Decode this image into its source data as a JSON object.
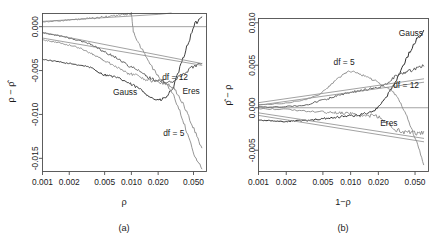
{
  "figure": {
    "background": "#ffffff",
    "panels": [
      {
        "tag": "(a)",
        "xlabel": "ρ",
        "ylabel": "ρ − ρ̂",
        "xticks": [
          "0.001",
          "0.002",
          "0.005",
          "0.010",
          "0.020",
          "0.050"
        ],
        "yticks": [
          "0.000",
          "-0.005",
          "-0.010",
          "-0.015"
        ],
        "curve_labels": [
          {
            "text": "Gauss",
            "x": 0.0085,
            "y": -0.0078
          },
          {
            "text": "df = 12",
            "x": 0.031,
            "y": -0.0061
          },
          {
            "text": "Eres",
            "x": 0.047,
            "y": -0.0077
          },
          {
            "text": "df = 5",
            "x": 0.03,
            "y": -0.0125
          }
        ]
      },
      {
        "tag": "(b)",
        "xlabel": "1−ρ",
        "ylabel": "ρ̂ − ρ",
        "xticks": [
          "0.001",
          "0.002",
          "0.005",
          "0.010",
          "0.020",
          "0.050"
        ],
        "yticks": [
          "0.010",
          "0.005",
          "0.000",
          "-0.005"
        ],
        "curve_labels": [
          {
            "text": "Gauss",
            "x": 0.045,
            "y": 0.0085
          },
          {
            "text": "df = 5",
            "x": 0.0085,
            "y": 0.005
          },
          {
            "text": "df = 12",
            "x": 0.04,
            "y": 0.0023
          },
          {
            "text": "Eres",
            "x": 0.026,
            "y": -0.0021
          }
        ]
      }
    ]
  },
  "chart_data": [
    {
      "type": "line",
      "panel": "(a)",
      "title": "",
      "xlabel": "ρ",
      "ylabel": "ρ − ρ̂",
      "xscale": "log",
      "xlim": [
        0.001,
        0.07
      ],
      "ylim": [
        -0.0165,
        0.0015
      ],
      "grid": false,
      "legend": "inline-annotations",
      "xticks": [
        0.001,
        0.002,
        0.005,
        0.01,
        0.02,
        0.05
      ],
      "xticklabels": [
        "0.001",
        "0.002",
        "0.005",
        "0.010",
        "0.020",
        "0.050"
      ],
      "yticks": [
        0.0,
        -0.005,
        -0.01,
        -0.015
      ],
      "yticklabels": [
        "0.000",
        "-0.005",
        "-0.010",
        "-0.015"
      ],
      "reference_lines": [
        {
          "y": 0.0,
          "style": "solid",
          "color": "#8c8c8c"
        }
      ],
      "series": [
        {
          "name": "Gauss",
          "color": "#404040",
          "width": 1.0,
          "x": [
            0.001,
            0.0012,
            0.0015,
            0.0018,
            0.0022,
            0.0027,
            0.0033,
            0.004,
            0.0048,
            0.0058,
            0.007,
            0.0085,
            0.01,
            0.012,
            0.0145,
            0.0175,
            0.021,
            0.025,
            0.03,
            0.036,
            0.043,
            0.052,
            0.062
          ],
          "y": [
            -0.0037,
            -0.00385,
            -0.004,
            -0.00415,
            -0.00425,
            -0.0044,
            -0.00455,
            -0.005,
            -0.00545,
            -0.0056,
            -0.00585,
            -0.0062,
            -0.0066,
            -0.007,
            -0.0076,
            -0.0082,
            -0.0084,
            -0.008,
            -0.0068,
            -0.0044,
            -0.002,
            0.0003,
            0.0011
          ]
        },
        {
          "name": "df = 5",
          "color": "#8a8a8a",
          "width": 0.9,
          "x": [
            0.001,
            0.0012,
            0.0015,
            0.0018,
            0.0022,
            0.0027,
            0.0033,
            0.004,
            0.0048,
            0.0058,
            0.007,
            0.0085,
            0.01,
            0.0105,
            0.012,
            0.0145,
            0.0175,
            0.021,
            0.025,
            0.03,
            0.036,
            0.043,
            0.052,
            0.062
          ],
          "y": [
            0.00055,
            0.0006,
            0.00065,
            0.00072,
            0.00078,
            0.00085,
            0.00092,
            0.001,
            0.00108,
            0.00118,
            0.00128,
            0.0014,
            0.0015,
            -0.0005,
            -0.0019,
            -0.0033,
            -0.0048,
            -0.0059,
            -0.0065,
            -0.0079,
            -0.0099,
            -0.0123,
            -0.0148,
            -0.0162
          ]
        },
        {
          "name": "df = 12",
          "color": "#5a5a5a",
          "width": 0.95,
          "x": [
            0.001,
            0.0012,
            0.0015,
            0.0018,
            0.0022,
            0.0027,
            0.0033,
            0.004,
            0.0048,
            0.0058,
            0.007,
            0.0085,
            0.01,
            0.012,
            0.0145,
            0.0175,
            0.021,
            0.025,
            0.03,
            0.036,
            0.043,
            0.052,
            0.062
          ],
          "y": [
            -0.0007,
            -0.00085,
            -0.001,
            -0.0012,
            -0.0014,
            -0.00165,
            -0.0019,
            -0.0023,
            -0.0028,
            -0.0032,
            -0.0036,
            -0.0042,
            -0.0046,
            -0.005,
            -0.0056,
            -0.006,
            -0.0062,
            -0.0064,
            -0.0062,
            -0.0056,
            -0.005,
            -0.0044,
            -0.0042
          ]
        },
        {
          "name": "Eres",
          "color": "#8a8a8a",
          "width": 0.9,
          "x": [
            0.001,
            0.0012,
            0.0015,
            0.0018,
            0.0022,
            0.0027,
            0.0033,
            0.004,
            0.0048,
            0.0058,
            0.007,
            0.0085,
            0.01,
            0.012,
            0.0145,
            0.0175,
            0.021,
            0.025,
            0.03,
            0.036,
            0.043,
            0.052,
            0.062
          ],
          "y": [
            -0.0015,
            -0.00165,
            -0.0018,
            -0.002,
            -0.0022,
            -0.0025,
            -0.0029,
            -0.0033,
            -0.0038,
            -0.0042,
            -0.0046,
            -0.0052,
            -0.0054,
            -0.0056,
            -0.006,
            -0.0062,
            -0.0064,
            -0.0065,
            -0.007,
            -0.0083,
            -0.01,
            -0.012,
            -0.0138
          ]
        },
        {
          "name": "theory-upper",
          "color": "#8a8a8a",
          "width": 0.8,
          "x": [
            0.001,
            0.02,
            0.028
          ],
          "y": [
            0.0006,
            0.0014,
            0.00155
          ]
        },
        {
          "name": "theory-mid",
          "color": "#8a8a8a",
          "width": 0.8,
          "x": [
            0.001,
            0.062
          ],
          "y": [
            -0.00065,
            -0.0042
          ]
        },
        {
          "name": "theory-lower",
          "color": "#8a8a8a",
          "width": 0.8,
          "x": [
            0.001,
            0.062
          ],
          "y": [
            -0.0013,
            -0.0044
          ]
        }
      ]
    },
    {
      "type": "line",
      "panel": "(b)",
      "title": "",
      "xlabel": "1−ρ",
      "ylabel": "ρ̂ − ρ",
      "xscale": "log",
      "xlim": [
        0.001,
        0.07
      ],
      "ylim": [
        -0.0075,
        0.0105
      ],
      "grid": false,
      "legend": "inline-annotations",
      "xticks": [
        0.001,
        0.002,
        0.005,
        0.01,
        0.02,
        0.05
      ],
      "xticklabels": [
        "0.001",
        "0.002",
        "0.005",
        "0.010",
        "0.020",
        "0.050"
      ],
      "yticks": [
        0.01,
        0.005,
        0.0,
        -0.005
      ],
      "yticklabels": [
        "0.010",
        "0.005",
        "0.000",
        "-0.005"
      ],
      "reference_lines": [
        {
          "y": 0.0,
          "style": "solid",
          "color": "#8c8c8c"
        }
      ],
      "series": [
        {
          "name": "Gauss",
          "color": "#303030",
          "width": 1.0,
          "x": [
            0.001,
            0.0012,
            0.0015,
            0.0018,
            0.0022,
            0.0027,
            0.0033,
            0.004,
            0.0048,
            0.0058,
            0.007,
            0.0085,
            0.01,
            0.012,
            0.0145,
            0.0175,
            0.021,
            0.025,
            0.03,
            0.036,
            0.043,
            0.052,
            0.062
          ],
          "y": [
            -0.00145,
            -0.0015,
            -0.00155,
            -0.0016,
            -0.0016,
            -0.00155,
            -0.0015,
            -0.0014,
            -0.0013,
            -0.0012,
            -0.0011,
            -0.001,
            -0.00095,
            -0.00085,
            -0.0007,
            -0.0004,
            0.0004,
            0.0014,
            0.0029,
            0.0046,
            0.0064,
            0.008,
            0.0091
          ]
        },
        {
          "name": "df = 5",
          "color": "#8a8a8a",
          "width": 0.9,
          "x": [
            0.001,
            0.0015,
            0.0022,
            0.0033,
            0.0048,
            0.0058,
            0.007,
            0.0085,
            0.01,
            0.012,
            0.0145,
            0.0175,
            0.021,
            0.025,
            0.03,
            0.036,
            0.043,
            0.052,
            0.062
          ],
          "y": [
            0.00035,
            0.00045,
            0.0006,
            0.00095,
            0.0017,
            0.0025,
            0.0033,
            0.004,
            0.0043,
            0.004,
            0.0037,
            0.0033,
            0.0028,
            0.0024,
            0.0017,
            0.0002,
            -0.0016,
            -0.004,
            -0.0067
          ]
        },
        {
          "name": "df = 12",
          "color": "#5a5a5a",
          "width": 0.95,
          "x": [
            0.001,
            0.0015,
            0.0022,
            0.0033,
            0.0048,
            0.0058,
            0.007,
            0.0085,
            0.01,
            0.012,
            0.0145,
            0.0175,
            0.021,
            0.025,
            0.03,
            0.036,
            0.043,
            0.052,
            0.062
          ],
          "y": [
            8e-05,
            0.0001,
            0.00015,
            0.00035,
            0.00085,
            0.0011,
            0.0014,
            0.00165,
            0.0018,
            0.00195,
            0.0021,
            0.0023,
            0.0025,
            0.0029,
            0.0036,
            0.0041,
            0.0043,
            0.0046,
            0.0049
          ]
        },
        {
          "name": "Eres",
          "color": "#8a8a8a",
          "width": 0.9,
          "x": [
            0.001,
            0.0015,
            0.0022,
            0.0033,
            0.0048,
            0.0058,
            0.007,
            0.0085,
            0.01,
            0.012,
            0.0145,
            0.0175,
            0.021,
            0.025,
            0.03,
            0.036,
            0.043,
            0.052,
            0.062
          ],
          "y": [
            -0.0001,
            -0.00015,
            -0.00025,
            -0.0004,
            -0.0005,
            -0.00055,
            -0.0006,
            -0.00065,
            -0.0007,
            -0.0009,
            -0.00105,
            -0.00085,
            -0.0012,
            -0.0018,
            -0.0025,
            -0.0028,
            -0.0029,
            -0.003,
            -0.0028
          ]
        },
        {
          "name": "theory-upper",
          "color": "#8a8a8a",
          "width": 0.8,
          "x": [
            0.001,
            0.062
          ],
          "y": [
            0.0006,
            0.0034
          ]
        },
        {
          "name": "theory-mid",
          "color": "#8a8a8a",
          "width": 0.8,
          "x": [
            0.001,
            0.062
          ],
          "y": [
            0.0003,
            0.003
          ]
        },
        {
          "name": "theory-lower",
          "color": "#8a8a8a",
          "width": 0.8,
          "x": [
            0.001,
            0.062
          ],
          "y": [
            -0.0006,
            -0.0036
          ]
        },
        {
          "name": "theory-lowest",
          "color": "#8a8a8a",
          "width": 0.8,
          "x": [
            0.001,
            0.062
          ],
          "y": [
            -0.0009,
            -0.004
          ]
        }
      ]
    }
  ]
}
